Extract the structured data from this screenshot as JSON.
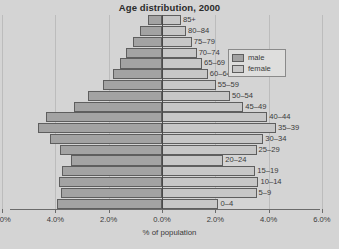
{
  "chart_data": {
    "type": "bar",
    "subtype": "population-pyramid",
    "title": "Age distribution, 2000",
    "xlabel": "% of population",
    "ylabel": "",
    "grid": true,
    "legend_position": "top-right",
    "xlim": [
      -6.0,
      6.0
    ],
    "xticks": [
      -6.0,
      -4.0,
      -2.0,
      0.0,
      2.0,
      4.0,
      6.0
    ],
    "xtick_labels": [
      "6.0%",
      "4.0%",
      "2.0%",
      "0.0%",
      "2.0%",
      "4.0%",
      "6.0%"
    ],
    "categories": [
      "85+",
      "80–84",
      "75–79",
      "70–74",
      "65–69",
      "60–64",
      "55–59",
      "50–54",
      "45–49",
      "40–44",
      "35–39",
      "30–34",
      "25–29",
      "20–24",
      "15–19",
      "10–14",
      "5–9",
      "0–4"
    ],
    "series": [
      {
        "name": "male",
        "color": "#a3a3a3",
        "direction": "left",
        "values": [
          0.53,
          0.82,
          1.09,
          1.35,
          1.58,
          1.85,
          2.22,
          2.78,
          3.3,
          4.35,
          4.65,
          4.2,
          3.82,
          3.4,
          3.75,
          3.85,
          3.8,
          3.94
        ]
      },
      {
        "name": "female",
        "color": "#c7c7c7",
        "direction": "right",
        "values": [
          0.71,
          0.9,
          1.12,
          1.3,
          1.5,
          1.72,
          2.02,
          2.55,
          3.05,
          3.95,
          4.28,
          3.8,
          3.55,
          2.3,
          3.5,
          3.62,
          3.55,
          2.12
        ]
      }
    ]
  },
  "legend": {
    "entries": [
      {
        "label": "male",
        "color": "#a3a3a3"
      },
      {
        "label": "female",
        "color": "#c7c7c7"
      }
    ]
  }
}
